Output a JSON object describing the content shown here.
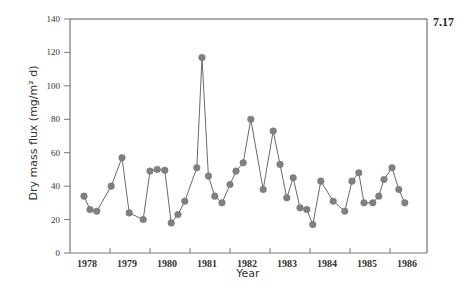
{
  "figure_number": "7.17",
  "chart_data": {
    "type": "line",
    "title": "",
    "xlabel": "Year",
    "ylabel": "Dry mass flux (mg/m² d)",
    "ylim": [
      0,
      140
    ],
    "xlim": [
      1978,
      1987
    ],
    "yticks": [
      0,
      20,
      40,
      60,
      80,
      100,
      120,
      140
    ],
    "xtick_labels": [
      "1978",
      "1979",
      "1980",
      "1981",
      "1982",
      "1983",
      "1984",
      "1985",
      "1986"
    ],
    "grid": false,
    "legend": null,
    "marker": "circle",
    "series": [
      {
        "name": "Dry mass flux",
        "color": "#808080",
        "x": [
          1978.35,
          1978.5,
          1978.67,
          1979.03,
          1979.3,
          1979.48,
          1979.83,
          1980.0,
          1980.18,
          1980.37,
          1980.53,
          1980.7,
          1980.87,
          1981.17,
          1981.3,
          1981.46,
          1981.62,
          1981.8,
          1982.0,
          1982.15,
          1982.33,
          1982.52,
          1982.83,
          1983.08,
          1983.25,
          1983.42,
          1983.58,
          1983.75,
          1983.92,
          1984.07,
          1984.27,
          1984.58,
          1984.87,
          1985.05,
          1985.22,
          1985.35,
          1985.57,
          1985.72,
          1985.85,
          1986.05,
          1986.22,
          1986.37
        ],
        "values": [
          34,
          26,
          25,
          40,
          57,
          24,
          20,
          49,
          50,
          49.5,
          18,
          23,
          31,
          51,
          117,
          46,
          34,
          30,
          41,
          49,
          54,
          80,
          38,
          73,
          53,
          33,
          45,
          27,
          26,
          17,
          43,
          31,
          25,
          43,
          48,
          30,
          30,
          34,
          44,
          51,
          38,
          30
        ]
      }
    ]
  }
}
